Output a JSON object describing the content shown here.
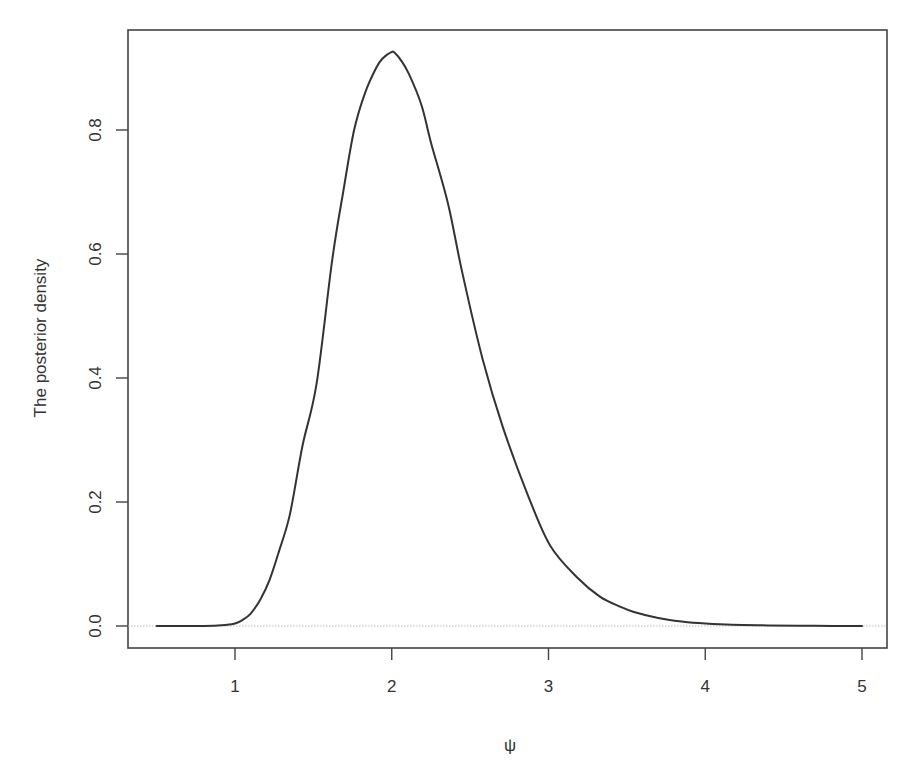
{
  "chart_data": {
    "type": "line",
    "title": "",
    "xlabel": "ψ",
    "ylabel": "The posterior density",
    "xlim": [
      0.35,
      5.15
    ],
    "ylim": [
      -0.036,
      0.96
    ],
    "xticks": [
      1,
      2,
      3,
      4,
      5
    ],
    "xtick_labels": [
      "1",
      "2",
      "3",
      "4",
      "5"
    ],
    "yticks": [
      0.0,
      0.2,
      0.4,
      0.6,
      0.8
    ],
    "ytick_labels": [
      "0.0",
      "0.2",
      "0.4",
      "0.6",
      "0.8"
    ],
    "grid": false,
    "legend": null,
    "reference_line": {
      "y": 0.0,
      "style": "dotted",
      "color": "#bbbbbb"
    },
    "series": [
      {
        "name": "posterior density",
        "color": "#333333",
        "x": [
          0.5,
          0.8,
          0.95,
          1.0,
          1.05,
          1.1,
          1.16,
          1.22,
          1.28,
          1.35,
          1.43,
          1.52,
          1.62,
          1.69,
          1.76,
          1.83,
          1.9,
          1.94,
          2.0,
          2.02,
          2.06,
          2.11,
          2.19,
          2.25,
          2.36,
          2.45,
          2.58,
          2.71,
          2.87,
          3.01,
          3.18,
          3.33,
          3.46,
          3.54,
          3.7,
          3.86,
          4.0,
          4.17,
          4.4,
          4.7,
          5.0
        ],
        "y": [
          0.0,
          0.0,
          0.002,
          0.004,
          0.01,
          0.02,
          0.042,
          0.074,
          0.12,
          0.18,
          0.29,
          0.39,
          0.59,
          0.7,
          0.8,
          0.86,
          0.9,
          0.915,
          0.926,
          0.924,
          0.912,
          0.89,
          0.84,
          0.78,
          0.68,
          0.57,
          0.43,
          0.32,
          0.21,
          0.13,
          0.079,
          0.047,
          0.031,
          0.023,
          0.013,
          0.007,
          0.004,
          0.002,
          0.001,
          0.0003,
          0.0
        ]
      }
    ]
  },
  "axes": {
    "x_label": "ψ",
    "y_label": "The posterior density",
    "x_ticks": [
      "1",
      "2",
      "3",
      "4",
      "5"
    ],
    "y_ticks": [
      "0.0",
      "0.2",
      "0.4",
      "0.6",
      "0.8"
    ]
  }
}
